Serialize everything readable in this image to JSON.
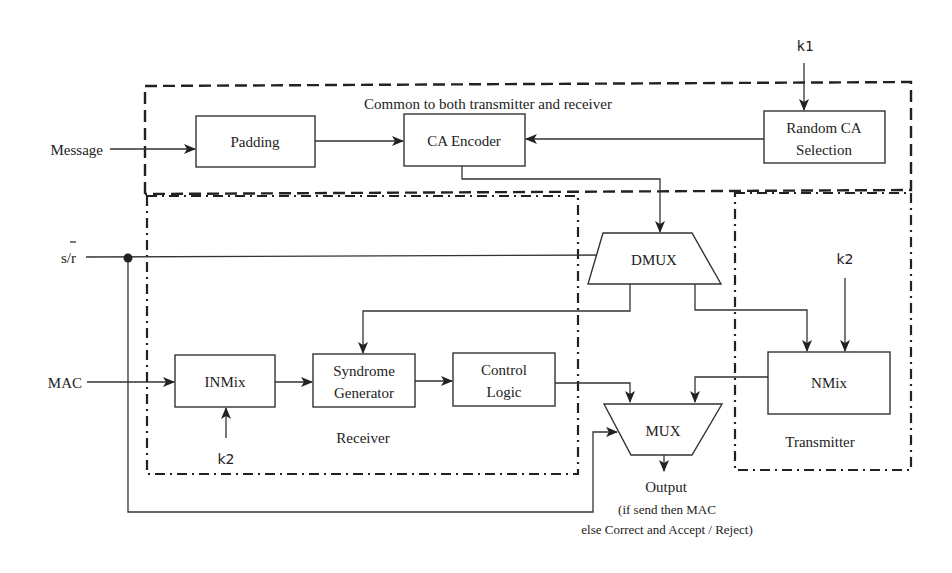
{
  "regions": {
    "common": {
      "label": "Common to both transmitter and receiver",
      "style": "dashed"
    },
    "receiver": {
      "label": "Receiver",
      "style": "dash-dot"
    },
    "transmitter": {
      "label": "Transmitter",
      "style": "dash-dot"
    }
  },
  "inputs": {
    "message": "Message",
    "select": "s/r",
    "select_overbar_on": "r",
    "mac": "MAC",
    "k1": "k1",
    "k2_receiver": "k2",
    "k2_transmitter": "k2"
  },
  "blocks": {
    "padding": {
      "lines": [
        "Padding"
      ]
    },
    "ca_encoder": {
      "lines": [
        "CA Encoder"
      ]
    },
    "random_ca": {
      "lines": [
        "Random CA",
        "Selection"
      ]
    },
    "dmux": {
      "lines": [
        "DMUX"
      ]
    },
    "inmix": {
      "lines": [
        "INMix"
      ]
    },
    "syndrome": {
      "lines": [
        "Syndrome",
        "Generator"
      ]
    },
    "control_logic": {
      "lines": [
        "Control",
        "Logic"
      ]
    },
    "nmix": {
      "lines": [
        "NMix"
      ]
    },
    "mux": {
      "lines": [
        "MUX"
      ]
    }
  },
  "output": {
    "label": "Output",
    "note_line1": "(if send then MAC",
    "note_line2": "else Correct and Accept / Reject)"
  },
  "colors": {
    "stroke": "#333333",
    "text": "#222222",
    "background": "#ffffff"
  }
}
